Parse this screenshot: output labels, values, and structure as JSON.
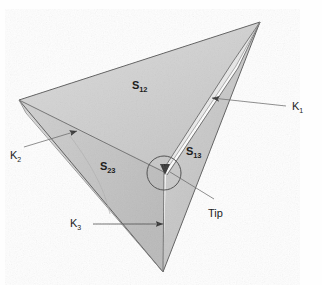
{
  "figure": {
    "background_color": "#fefefe",
    "ink_color": "#3a3a3a",
    "surface_fill_light": "#d8d8d8",
    "surface_fill_mid": "#c9c9c9",
    "surface_fill_dark": "#bdbdbd",
    "crack_fill": "#fdfdfd"
  },
  "surfaces": [
    {
      "id": "s12",
      "label_base": "S",
      "label_sub": "12",
      "x": 132,
      "y": 80
    },
    {
      "id": "s23",
      "label_base": "S",
      "label_sub": "23",
      "x": 100,
      "y": 161
    },
    {
      "id": "s13",
      "label_base": "S",
      "label_sub": "13",
      "x": 186,
      "y": 146
    }
  ],
  "vectors": [
    {
      "id": "k1",
      "label_base": "K",
      "label_sub": "1",
      "x": 292,
      "y": 101
    },
    {
      "id": "k2",
      "label_base": "K",
      "label_sub": "2",
      "x": 10,
      "y": 150
    },
    {
      "id": "k3",
      "label_base": "K",
      "label_sub": "3",
      "x": 70,
      "y": 218
    }
  ],
  "annotations": [
    {
      "id": "tip",
      "text": "Tip",
      "x": 208,
      "y": 208
    }
  ]
}
